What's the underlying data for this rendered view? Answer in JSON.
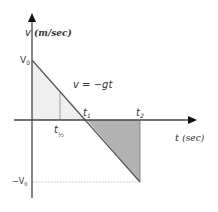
{
  "diagram": {
    "y_axis": {
      "label_var": "v",
      "label_unit": "(m/sec)"
    },
    "x_axis": {
      "label_var": "t",
      "label_unit": "(sec)"
    },
    "equation": "v = −gt",
    "labels": {
      "v0": "V",
      "v0_sub": "0",
      "neg_v0": "−V",
      "neg_v0_sub": "0",
      "t1": "t",
      "t1_sub": "1",
      "t2": "t",
      "t2_sub": "2",
      "thalf": "t",
      "thalf_sub": "½"
    },
    "colors": {
      "axis": "#444444",
      "line": "#555555",
      "area_positive": "#efefef",
      "area_negative": "#b3b3b3",
      "dashed": "#aaaaaa"
    }
  }
}
